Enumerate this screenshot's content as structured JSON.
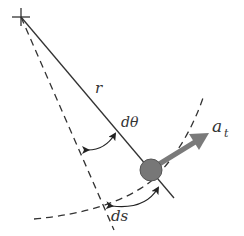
{
  "diagram": {
    "labels": {
      "radius": "r",
      "angle": "dθ",
      "arc_length": "ds",
      "accel_base": "a",
      "accel_sub": "t"
    },
    "colors": {
      "line": "#333333",
      "ball": "#777777",
      "arrow": "#7a7a7a",
      "background": "#ffffff"
    },
    "elements": [
      "pivot-cross",
      "radius-line",
      "dashed-reference-radius",
      "dashed-arc",
      "bob",
      "tangential-acceleration-arrow",
      "angle-arc-dtheta",
      "arc-length-ds"
    ]
  }
}
